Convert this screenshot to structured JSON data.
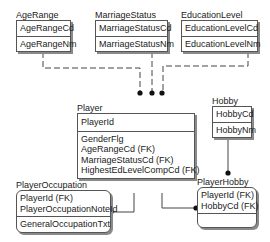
{
  "diagram": {
    "type": "entity-relationship",
    "entities": [
      {
        "id": "AgeRange",
        "name": "AgeRange",
        "keys": [
          "AgeRangeCd"
        ],
        "attributes": [
          "AgeRangeNm"
        ]
      },
      {
        "id": "MarriageStatus",
        "name": "MarriageStatus",
        "keys": [
          "MarriageStatusCd"
        ],
        "attributes": [
          "MarriageStatusNm"
        ]
      },
      {
        "id": "EducationLevel",
        "name": "EducationLevel",
        "keys": [
          "EducationLevelCd"
        ],
        "attributes": [
          "EducationLevelNm"
        ]
      },
      {
        "id": "Player",
        "name": "Player",
        "keys": [
          "PlayerId"
        ],
        "attributes": [
          "GenderFlg",
          "AgeRangeCd (FK)",
          "MarriageStatusCd (FK)",
          "HighestEdLevelCompCd (FK)"
        ]
      },
      {
        "id": "Hobby",
        "name": "Hobby",
        "keys": [
          "HobbyCd"
        ],
        "attributes": [
          "HobbyNm"
        ]
      },
      {
        "id": "PlayerOccupation",
        "name": "PlayerOccupation",
        "keys": [
          "PlayerId (FK)",
          "PlayerOccupationNoteId"
        ],
        "attributes": [
          "GeneralOccupationTxt"
        ]
      },
      {
        "id": "PlayerHobby",
        "name": "PlayerHobby",
        "keys": [
          "PlayerId (FK)",
          "HobbyCd (FK)"
        ],
        "attributes": []
      }
    ],
    "relationships": [
      {
        "from": "AgeRange",
        "to": "Player",
        "style": "dashed",
        "end": "dot"
      },
      {
        "from": "MarriageStatus",
        "to": "Player",
        "style": "dashed",
        "end": "dot"
      },
      {
        "from": "EducationLevel",
        "to": "Player",
        "style": "dashed",
        "end": "dot"
      },
      {
        "from": "Player",
        "to": "PlayerOccupation",
        "style": "solid",
        "end": "dot"
      },
      {
        "from": "Player",
        "to": "PlayerHobby",
        "style": "solid",
        "end": "dot"
      },
      {
        "from": "Hobby",
        "to": "PlayerHobby",
        "style": "solid",
        "end": "dot"
      }
    ]
  },
  "colors": {
    "line": "#444444",
    "border": "#555555",
    "shadow": "#8a8a8a",
    "background": "#ffffff"
  }
}
